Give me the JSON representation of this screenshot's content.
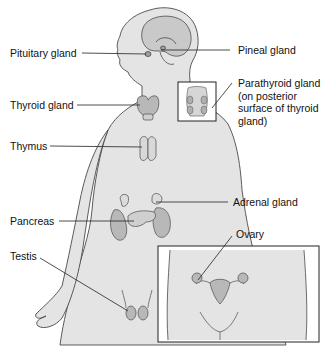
{
  "figure": {
    "colors": {
      "body_fill": "#e4e4e4",
      "outline": "#4a4a4a",
      "gland_fill": "#b8b8b8",
      "brain_fill": "#c9c9c9",
      "leader_line": "#222222",
      "text": "#111111",
      "inset_border": "#222222"
    },
    "labels": {
      "pituitary": "Pituitary gland",
      "pineal": "Pineal gland",
      "thyroid": "Thyroid gland",
      "parathyroid": "Parathyroid gland\n(on posterior\nsurface of thyroid\ngland)",
      "thymus": "Thymus",
      "adrenal": "Adrenal gland",
      "pancreas": "Pancreas",
      "ovary": "Ovary",
      "testis": "Testis"
    },
    "insets": [
      {
        "name": "parathyroid-inset",
        "subject": "posterior thyroid view"
      },
      {
        "name": "female-pelvis-inset",
        "subject": "uterus and ovaries"
      }
    ]
  }
}
